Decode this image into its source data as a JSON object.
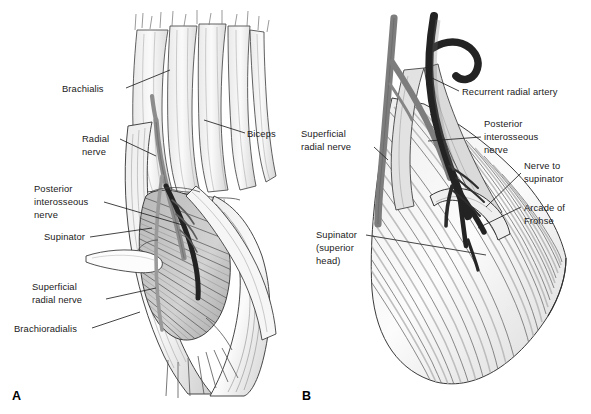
{
  "figure": {
    "background_color": "#ffffff",
    "ink_color": "#1a1a1a",
    "panels": [
      {
        "letter": "A",
        "name": "panel-a",
        "description": "Anterior view of elbow showing brachialis, biceps, radial nerve dividing into posterior interosseous and superficial radial nerves, supinator and brachioradialis",
        "labels": [
          {
            "id": "brachialis",
            "text": "Brachialis",
            "lines": [
              "Brachialis"
            ]
          },
          {
            "id": "radial-nerve",
            "text": "Radial nerve",
            "lines": [
              "Radial",
              "nerve"
            ]
          },
          {
            "id": "posterior-interosseous-nerve-a",
            "text": "Posterior interosseous nerve",
            "lines": [
              "Posterior",
              "interosseous",
              "nerve"
            ]
          },
          {
            "id": "supinator-a",
            "text": "Supinator",
            "lines": [
              "Supinator"
            ]
          },
          {
            "id": "superficial-radial-nerve-a",
            "text": "Superficial radial nerve",
            "lines": [
              "Superficial",
              "radial nerve"
            ]
          },
          {
            "id": "brachioradialis",
            "text": "Brachioradialis",
            "lines": [
              "Brachioradialis"
            ]
          },
          {
            "id": "biceps",
            "text": "Biceps",
            "lines": [
              "Biceps"
            ]
          }
        ]
      },
      {
        "letter": "B",
        "name": "panel-b",
        "description": "Deep dissection showing recurrent radial artery, posterior interosseous nerve passing under the arcade of Frohse, nerve to supinator and superior head of supinator",
        "labels": [
          {
            "id": "recurrent-radial-artery",
            "text": "Recurrent radial artery",
            "lines": [
              "Recurrent radial artery"
            ]
          },
          {
            "id": "posterior-interosseous-nerve-b",
            "text": "Posterior interosseous nerve",
            "lines": [
              "Posterior",
              "interosseous",
              "nerve"
            ]
          },
          {
            "id": "nerve-to-supinator",
            "text": "Nerve to supinator",
            "lines": [
              "Nerve to",
              "supinator"
            ]
          },
          {
            "id": "arcade-of-frohse",
            "text": "Arcade of Frohse",
            "lines": [
              "Arcade of",
              "Frohse"
            ]
          },
          {
            "id": "superficial-radial-nerve-b",
            "text": "Superficial radial nerve",
            "lines": [
              "Superficial",
              "radial nerve"
            ]
          },
          {
            "id": "supinator-superior-head",
            "text": "Supinator (superior head)",
            "lines": [
              "Supinator",
              "(superior",
              "head)"
            ]
          }
        ]
      }
    ]
  },
  "text": {
    "panel_a_letter": "A",
    "panel_b_letter": "B",
    "brachialis": "Brachialis",
    "biceps": "Biceps",
    "radial_1": "Radial",
    "radial_2": "nerve",
    "pin_a_1": "Posterior",
    "pin_a_2": "interosseous",
    "pin_a_3": "nerve",
    "supinator_a": "Supinator",
    "srn_a_1": "Superficial",
    "srn_a_2": "radial nerve",
    "brachioradialis": "Brachioradialis",
    "recurrent_radial_artery": "Recurrent radial artery",
    "pin_b_1": "Posterior",
    "pin_b_2": "interosseous",
    "pin_b_3": "nerve",
    "nts_1": "Nerve to",
    "nts_2": "supinator",
    "arcade_1": "Arcade of",
    "arcade_2": "Frohse",
    "srn_b_1": "Superficial",
    "srn_b_2": "radial nerve",
    "sup_sh_1": "Supinator",
    "sup_sh_2": "(superior",
    "sup_sh_3": "head)"
  },
  "colors": {
    "background": "#ffffff",
    "outline": "#1a1a1a",
    "muscle_light": "#f2f2f2",
    "muscle_mid": "#d9d9d9",
    "muscle_shade": "#b4b4b4",
    "nerve_gray": "#8e8e8e",
    "artery_dark": "#2b2b2b",
    "tendon_white": "#fbfbfb"
  }
}
